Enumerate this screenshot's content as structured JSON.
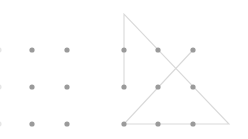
{
  "diagram": {
    "colors": {
      "background": "#ffffff",
      "dot": "#9a9a9a",
      "line": "#d9d9d9"
    },
    "dot_radius": 2.6,
    "line_width": 1.1,
    "unsolved_grid": {
      "label": "Unsolved 3x3 dot grid",
      "partial_edge_column_x": 0,
      "dots": [
        {
          "x": 32,
          "y": 50
        },
        {
          "x": 67,
          "y": 50
        },
        {
          "x": 32,
          "y": 87
        },
        {
          "x": 67,
          "y": 87
        },
        {
          "x": 32,
          "y": 124
        },
        {
          "x": 67,
          "y": 124
        }
      ]
    },
    "solved_grid": {
      "label": "Solution: four connected straight lines through nine dots",
      "dots": [
        {
          "x": 124,
          "y": 50
        },
        {
          "x": 158,
          "y": 50
        },
        {
          "x": 193,
          "y": 50
        },
        {
          "x": 124,
          "y": 87
        },
        {
          "x": 158,
          "y": 87
        },
        {
          "x": 193,
          "y": 87
        },
        {
          "x": 124,
          "y": 124
        },
        {
          "x": 158,
          "y": 124
        },
        {
          "x": 193,
          "y": 124
        }
      ],
      "path": [
        {
          "x": 124,
          "y": 87
        },
        {
          "x": 124,
          "y": 14
        },
        {
          "x": 229,
          "y": 124
        },
        {
          "x": 124,
          "y": 124
        },
        {
          "x": 193,
          "y": 50
        }
      ]
    }
  }
}
